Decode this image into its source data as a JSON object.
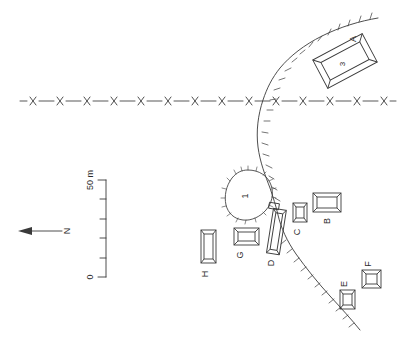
{
  "figure": {
    "kind": "archaeological-site-plan",
    "background_color": "#ffffff",
    "ink_color": "#3a3a3a",
    "width": 401,
    "height": 359
  },
  "scale_bar": {
    "name": "scale-bar",
    "top_label": "50 m",
    "bottom_label": "0",
    "units": "m",
    "max_value": 50,
    "min_value": 0,
    "divisions": 5,
    "orientation": "vertical"
  },
  "north_arrow": {
    "name": "north-arrow",
    "label": "N",
    "points_toward": "left"
  },
  "structures": [
    {
      "id": "A",
      "label": "A",
      "interior_label": "3",
      "shape": "rectangle-double-wall",
      "orientation": "oblique",
      "x": 345,
      "y": 61
    },
    {
      "id": "B",
      "label": "B",
      "interior_label": "",
      "shape": "rectangle-double-wall",
      "orientation": "horizontal",
      "x": 327,
      "y": 203
    },
    {
      "id": "C",
      "label": "C",
      "interior_label": "",
      "shape": "rectangle-double-wall",
      "orientation": "vertical",
      "x": 300,
      "y": 212
    },
    {
      "id": "D",
      "label": "D",
      "interior_label": "",
      "shape": "elongated-narrow",
      "orientation": "tilted",
      "x": 276,
      "y": 231
    },
    {
      "id": "E",
      "label": "E",
      "interior_label": "",
      "shape": "rectangle-double-wall",
      "orientation": "vertical",
      "x": 347,
      "y": 299
    },
    {
      "id": "F",
      "label": "F",
      "interior_label": "",
      "shape": "rectangle-double-wall",
      "orientation": "square",
      "x": 371,
      "y": 280
    },
    {
      "id": "G",
      "label": "G",
      "interior_label": "",
      "shape": "rectangle-double-wall",
      "orientation": "horizontal",
      "x": 246,
      "y": 236
    },
    {
      "id": "H",
      "label": "H",
      "interior_label": "",
      "shape": "rectangle-double-wall",
      "orientation": "vertical",
      "x": 208,
      "y": 247
    }
  ],
  "features": [
    {
      "id": "1",
      "label": "1",
      "name": "mound-enclosure",
      "shape": "irregular-oval-with-hachures",
      "x": 248,
      "y": 196
    }
  ],
  "lines": [
    {
      "name": "fence-line",
      "style": "dash-x-dash",
      "symbol": "x",
      "symbol_count": 14,
      "orientation": "horizontal",
      "y": 101
    },
    {
      "name": "escarpment-line",
      "style": "solid-with-hachures",
      "orientation": "curved-north-south"
    }
  ]
}
